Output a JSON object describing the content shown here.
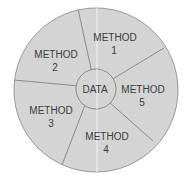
{
  "diagram": {
    "center": {
      "label": "DATA"
    },
    "segments": [
      {
        "line1": "METHOD",
        "line2": "1"
      },
      {
        "line1": "METHOD",
        "line2": "2"
      },
      {
        "line1": "METHOD",
        "line2": "3"
      },
      {
        "line1": "METHOD",
        "line2": "4"
      },
      {
        "line1": "METHOD",
        "line2": "5"
      }
    ],
    "colors": {
      "fill": "#d4d4d4",
      "stroke": "#8a8a8a",
      "text": "#3a3a3a",
      "background": "#ffffff"
    }
  }
}
